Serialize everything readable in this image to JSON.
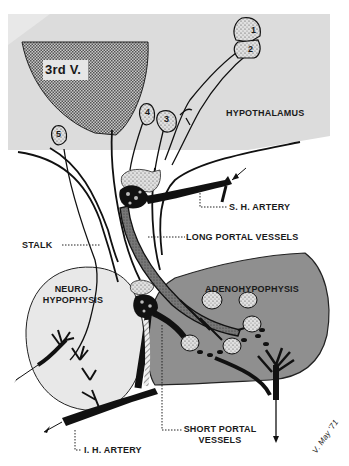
{
  "diagram": {
    "type": "anatomical illustration",
    "colors": {
      "background": "#ffffff",
      "hypothalamus_fill": "#dcdcdc",
      "third_ventricle_fill": "#9a9a9a",
      "adenohypophysis_fill": "#8f8f8f",
      "neurohypophysis_fill": "#e6e6e6",
      "vessel": "#1a1a1a",
      "portal_vessel_fill": "#6a6a6a",
      "neuron_fill": "#d8d8d8",
      "line": "#111111"
    },
    "labels": {
      "third_ventricle": "3rd V.",
      "hypothalamus": "HYPOTHALAMUS",
      "sh_artery": "S. H. ARTERY",
      "stalk": "STALK",
      "long_portal_vessels": "LONG PORTAL VESSELS",
      "neurohypophysis_line1": "NEURO-",
      "neurohypophysis_line2": "HYPOPHYSIS",
      "adenohypophysis": "ADENOHYPOPHYSIS",
      "ih_artery": "I. H. ARTERY",
      "short_portal_vessels_line1": "SHORT PORTAL",
      "short_portal_vessels_line2": "VESSELS",
      "signature": "V. May '71"
    },
    "neurons": [
      {
        "id": "1",
        "label": "1"
      },
      {
        "id": "2",
        "label": "2"
      },
      {
        "id": "3",
        "label": "3"
      },
      {
        "id": "4",
        "label": "4"
      },
      {
        "id": "5",
        "label": "5"
      }
    ]
  }
}
